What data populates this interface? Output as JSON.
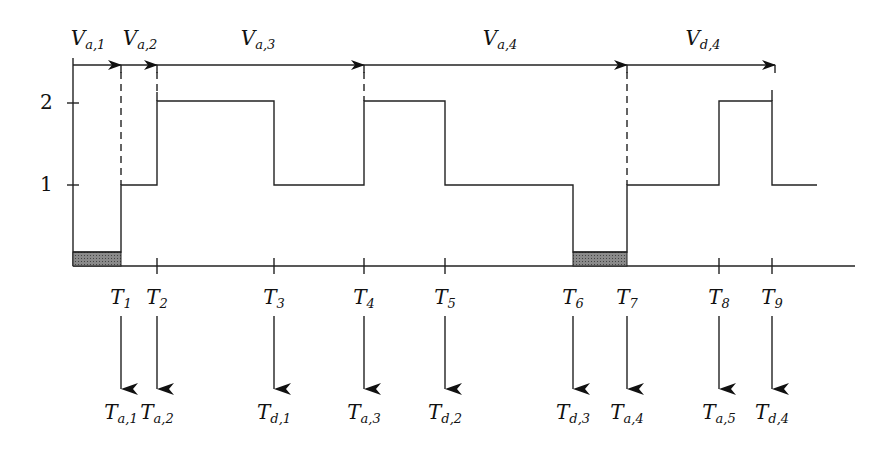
{
  "diagram": {
    "type": "queue-length timing diagram",
    "y_axis": {
      "ticks": [
        {
          "label": "2",
          "y": 103
        },
        {
          "label": "1",
          "y": 185
        }
      ]
    },
    "top_intervals": [
      {
        "base": "V",
        "sub": "a,1",
        "x_start": 73,
        "x_end": 121,
        "label_x": 88
      },
      {
        "base": "V",
        "sub": "a,2",
        "x_start": 121,
        "x_end": 157,
        "label_x": 140
      },
      {
        "base": "V",
        "sub": "a,3",
        "x_start": 157,
        "x_end": 364,
        "label_x": 258
      },
      {
        "base": "V",
        "sub": "a,4",
        "x_start": 364,
        "x_end": 627,
        "label_x": 500
      },
      {
        "base": "V",
        "sub": "d,4",
        "x_start": 627,
        "x_end": 775,
        "label_x": 703
      }
    ],
    "time_points": [
      {
        "base": "T",
        "sub": "1",
        "x": 121,
        "event_base": "T",
        "event_sub": "a,1"
      },
      {
        "base": "T",
        "sub": "2",
        "x": 157,
        "event_base": "T",
        "event_sub": "a,2"
      },
      {
        "base": "T",
        "sub": "3",
        "x": 274,
        "event_base": "T",
        "event_sub": "d,1"
      },
      {
        "base": "T",
        "sub": "4",
        "x": 364,
        "event_base": "T",
        "event_sub": "a,3"
      },
      {
        "base": "T",
        "sub": "5",
        "x": 445,
        "event_base": "T",
        "event_sub": "d,2"
      },
      {
        "base": "T",
        "sub": "6",
        "x": 573,
        "event_base": "T",
        "event_sub": "d,3"
      },
      {
        "base": "T",
        "sub": "7",
        "x": 627,
        "event_base": "T",
        "event_sub": "a,4"
      },
      {
        "base": "T",
        "sub": "8",
        "x": 719,
        "event_base": "T",
        "event_sub": "a,5"
      },
      {
        "base": "T",
        "sub": "9",
        "x": 772,
        "event_base": "T",
        "event_sub": "d,4"
      }
    ],
    "step_levels": [
      {
        "from": 73,
        "to": 121,
        "level": 0,
        "shaded": true
      },
      {
        "from": 121,
        "to": 157,
        "level": 1
      },
      {
        "from": 157,
        "to": 274,
        "level": 2
      },
      {
        "from": 274,
        "to": 364,
        "level": 1
      },
      {
        "from": 364,
        "to": 445,
        "level": 2
      },
      {
        "from": 445,
        "to": 573,
        "level": 1
      },
      {
        "from": 573,
        "to": 627,
        "level": 0,
        "shaded": true
      },
      {
        "from": 627,
        "to": 719,
        "level": 1
      },
      {
        "from": 719,
        "to": 772,
        "level": 2
      },
      {
        "from": 772,
        "to": 817,
        "level": 1
      }
    ],
    "colors": {
      "line": "#222222",
      "shade": "#777777",
      "background": "#ffffff"
    }
  }
}
